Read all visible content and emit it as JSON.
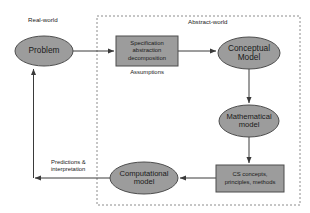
{
  "diagram": {
    "background": "#ffffff",
    "shape_fill": "#9c9c9c",
    "shape_stroke": "#4d4d4d",
    "line_color": "#3a3a3a",
    "region_border_color": "#8c8c8c",
    "text_color": "#1a1a1a"
  },
  "regions": [
    {
      "id": "real-world",
      "label": "Real-world",
      "style": "none",
      "label_x": 28,
      "label_y": 19
    },
    {
      "id": "abstract-world",
      "label": "Abstract-world",
      "style": "dashed",
      "x": 97,
      "y": 16,
      "width": 203,
      "height": 189,
      "label_x": 188,
      "label_y": 21
    }
  ],
  "nodes": [
    {
      "id": "problem",
      "shape": "ellipse",
      "label": "Problem",
      "cx": 44,
      "cy": 51,
      "rx": 29,
      "ry": 15
    },
    {
      "id": "specification",
      "shape": "rect",
      "label": "Specification\nabstraction\ndecomposition",
      "x": 116,
      "y": 36,
      "width": 62,
      "height": 30
    },
    {
      "id": "conceptual-model",
      "shape": "ellipse",
      "label": "Conceptual\nModel",
      "cx": 249,
      "cy": 53,
      "rx": 31,
      "ry": 16
    },
    {
      "id": "mathematical-model",
      "shape": "ellipse",
      "label": "Mathematical\nmodel",
      "cx": 249,
      "cy": 121,
      "rx": 30,
      "ry": 16
    },
    {
      "id": "cs-concepts",
      "shape": "rect",
      "label": "CS concepts,\nprinciples, methods",
      "x": 216,
      "y": 165,
      "width": 68,
      "height": 27
    },
    {
      "id": "computational-model",
      "shape": "ellipse",
      "label": "Computational\nmodel",
      "cx": 144,
      "cy": 178,
      "rx": 34,
      "ry": 16
    }
  ],
  "edge_labels": [
    {
      "id": "assumptions",
      "label": "Assumptions",
      "x": 121,
      "y": 71
    },
    {
      "id": "predictions-interpretation",
      "label": "Predictions &\ninterpretation",
      "x": 51,
      "y": 160
    }
  ],
  "edges": [
    {
      "id": "problem-to-specification",
      "from": "problem",
      "to": "specification",
      "arrow": "end"
    },
    {
      "id": "specification-to-conceptual-model",
      "from": "specification",
      "to": "conceptual-model",
      "arrow": "end"
    },
    {
      "id": "conceptual-to-mathematical",
      "from": "conceptual-model",
      "to": "mathematical-model",
      "arrow": "end"
    },
    {
      "id": "mathematical-to-cs-concepts",
      "from": "mathematical-model",
      "to": "cs-concepts",
      "arrow": "end"
    },
    {
      "id": "cs-concepts-to-computational",
      "from": "cs-concepts",
      "to": "computational-model",
      "arrow": "end"
    },
    {
      "id": "computational-to-problem",
      "from": "computational-model",
      "to": "problem",
      "arrow": "end"
    }
  ]
}
